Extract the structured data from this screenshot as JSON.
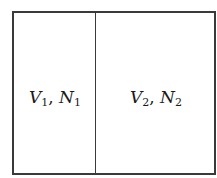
{
  "diagram": {
    "type": "partitioned-container",
    "compartments": [
      {
        "volume_symbol": "V",
        "volume_index": "1",
        "particles_symbol": "N",
        "particles_index": "1",
        "separator": ", "
      },
      {
        "volume_symbol": "V",
        "volume_index": "2",
        "particles_symbol": "N",
        "particles_index": "2",
        "separator": ", "
      }
    ],
    "colors": {
      "line": "#3a3a3a",
      "text": "#1a1a1a",
      "background": "#ffffff"
    }
  }
}
